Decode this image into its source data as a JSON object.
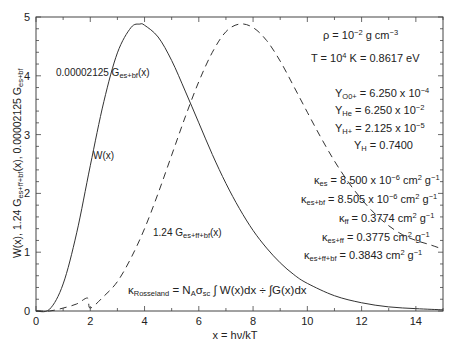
{
  "chart_data": {
    "type": "line",
    "title": "",
    "xlabel": "x = hν/kT",
    "ylabel": "W(x), 1.24 G_es+ff+bf(x), 0.00002125 G_es+bf",
    "xlim": [
      0,
      15
    ],
    "ylim": [
      0,
      5
    ],
    "x_ticks": [
      0,
      2,
      4,
      6,
      8,
      10,
      12,
      14
    ],
    "y_ticks": [
      0,
      1,
      2,
      3,
      4,
      5
    ],
    "grid": false,
    "series": [
      {
        "name": "W(x)",
        "style": "solid",
        "x": [
          0,
          0.5,
          1,
          1.5,
          2,
          2.5,
          3,
          3.5,
          3.83,
          4,
          4.5,
          5,
          5.5,
          6,
          6.5,
          7,
          7.5,
          8,
          8.5,
          9,
          9.5,
          10,
          11,
          12,
          13,
          14,
          15
        ],
        "y": [
          0,
          0.03,
          0.46,
          1.33,
          2.47,
          3.56,
          4.39,
          4.82,
          4.88,
          4.86,
          4.66,
          4.26,
          3.74,
          3.2,
          2.66,
          2.17,
          1.74,
          1.37,
          1.07,
          0.82,
          0.62,
          0.47,
          0.26,
          0.14,
          0.07,
          0.04,
          0.02
        ]
      },
      {
        "name": "1.24 G_es+ff+bf(x)",
        "style": "dashed",
        "x": [
          0,
          0.5,
          1,
          1.5,
          1.9,
          2.0,
          2.5,
          3,
          3.5,
          4,
          4.5,
          5,
          5.5,
          6,
          6.5,
          7,
          7.5,
          8,
          8.5,
          9,
          9.5,
          10,
          10.5,
          11,
          11.5,
          12,
          12.5,
          13,
          13.5,
          14,
          14.5,
          15
        ],
        "y": [
          0,
          0.0,
          0.05,
          0.12,
          0.22,
          0.05,
          0.25,
          0.5,
          0.9,
          1.4,
          2.0,
          2.65,
          3.3,
          3.9,
          4.4,
          4.75,
          4.88,
          4.82,
          4.6,
          4.25,
          3.82,
          3.38,
          2.95,
          2.55,
          2.2,
          1.9,
          1.65,
          1.45,
          1.3,
          1.2,
          1.13,
          1.05
        ]
      }
    ],
    "annotations": {
      "curve_label_gbf": "0.00002125 G_es+bf(x)",
      "curve_label_w": "W(x)",
      "curve_label_gfull": "1.24 G_es+ff+bf(x)",
      "rho": "ρ = 10^-2 g cm^-3",
      "temp": "T = 10^4 K = 0.8617 eV",
      "abundances": [
        "Y_O0+ = 6.250 x 10^-4",
        "Y_He = 6.250 x 10^-2",
        "Y_H+ = 2.125 x 10^-5",
        "Y_H = 0.7400"
      ],
      "opacities": [
        "κ_es = 8.500 x 10^-6 cm^2 g^-1",
        "κ_es+bf = 8.505 x 10^-6 cm^2 g^-1",
        "κ_ff = 0.3774 cm^2 g^-1",
        "κ_es+ff = 0.3775 cm^2 g^-1",
        "κ_es+ff+bf = 0.3843 cm^2 g^-1"
      ],
      "formula": "κ_Rosseland = N_A σ_sc ∫W(x)dx ÷ ∫G(x)dx"
    }
  },
  "labels": {
    "ylabel_main": "W(x), 1.24 G",
    "ylabel_sub1": "es+ff+bf",
    "ylabel_mid": "(x), 0.00002125 G",
    "ylabel_sub2": "es+bf",
    "xlabel": "x = hν/kT",
    "gbf_main": "0.00002125 G",
    "gbf_sub": "es+bf",
    "gbf_tail": "(x)",
    "w_label": "W(x)",
    "gfull_main": "1.24 G",
    "gfull_sub": "es+ff+bf",
    "gfull_tail": "(x)",
    "rho_a": "ρ = 10",
    "rho_exp": "−2",
    "rho_b": " g cm",
    "rho_exp2": "−3",
    "t_a": "T = 10",
    "t_exp": "4",
    "t_b": " K = 0.8617 eV",
    "y1_a": "Y",
    "y1_sub": "O0+",
    "y1_b": " = 6.250 x 10",
    "y1_exp": "−4",
    "y2_a": "Y",
    "y2_sub": "He",
    "y2_b": " = 6.250 x 10",
    "y2_exp": "−2",
    "y3_a": "Y",
    "y3_sub": "H+",
    "y3_b": " = 2.125 x 10",
    "y3_exp": "−5",
    "y4_a": "Y",
    "y4_sub": "H",
    "y4_b": " = 0.7400",
    "k1_a": "κ",
    "k1_sub": "es",
    "k1_b": " = 8.500 x 10",
    "k1_exp": "−6",
    "k1_c": " cm",
    "k1_e2": "2",
    "k1_d": " g",
    "k1_e3": "−1",
    "k2_a": "κ",
    "k2_sub": "es+bf",
    "k2_b": " = 8.505 x 10",
    "k2_exp": "−6",
    "k2_c": " cm",
    "k2_e2": "2",
    "k2_d": " g",
    "k2_e3": "−1",
    "k3_a": "κ",
    "k3_sub": "ff",
    "k3_b": " = 0.3774 cm",
    "k3_e2": "2",
    "k3_d": " g",
    "k3_e3": "−1",
    "k4_a": "κ",
    "k4_sub": "es+ff",
    "k4_b": " = 0.3775 cm",
    "k4_e2": "2",
    "k4_d": " g",
    "k4_e3": "−1",
    "k5_a": "κ",
    "k5_sub": "es+ff+bf",
    "k5_b": " = 0.3843 cm",
    "k5_e2": "2",
    "k5_d": " g",
    "k5_e3": "−1",
    "f_a": "κ",
    "f_sub": "Rosseland",
    "f_b": " = N",
    "f_sub2": "A",
    "f_c": "σ",
    "f_sub3": "sc",
    "f_d": " ∫ W(x)dx ÷ ∫G(x)dx"
  }
}
